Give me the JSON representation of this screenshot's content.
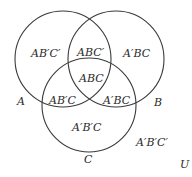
{
  "diagram": {
    "type": "venn-3-set",
    "circles": [
      {
        "name": "A",
        "cx": 63,
        "cy": 59,
        "r": 48
      },
      {
        "name": "B",
        "cx": 116,
        "cy": 59,
        "r": 48
      },
      {
        "name": "C",
        "cx": 89,
        "cy": 105,
        "r": 47
      }
    ],
    "set_labels": {
      "A": "A",
      "B": "B",
      "C": "C",
      "U": "U"
    },
    "regions": {
      "a_only": "AB′C′",
      "ab_only": "ABC′",
      "b_only": "A′BC",
      "abc": "ABC",
      "ac_only": "AB′C",
      "bc_only": "A′BC",
      "c_only": "A′B′C",
      "none": "A′B′C′"
    },
    "colors": {
      "stroke": "#3a3a3a",
      "text": "#2a2a2a",
      "background": "#ffffff"
    }
  }
}
